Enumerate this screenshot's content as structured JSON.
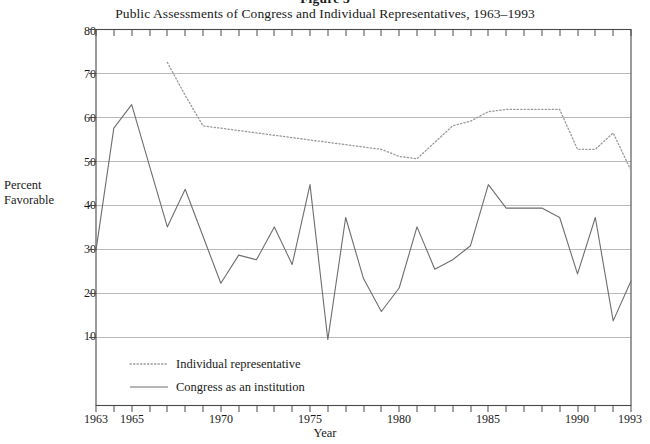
{
  "figure": {
    "number": "Figure 3",
    "title": "Public Assessments of Congress and Individual Representatives, 1963–1993"
  },
  "axes": {
    "y_title_line1": "Percent",
    "y_title_line2": "Favorable",
    "x_title": "Year",
    "y_ticks": [
      "80",
      "70",
      "60",
      "50",
      "40",
      "30",
      "20",
      "10"
    ],
    "x_ticks": [
      "1963",
      "1965",
      "1970",
      "1975",
      "1980",
      "1985",
      "1990",
      "1993"
    ]
  },
  "legend": {
    "items": [
      {
        "label": "Individual representative",
        "style": "dotted",
        "color": "#9a9a9a"
      },
      {
        "label": "Congress as an institution",
        "style": "solid",
        "color": "#6e6e6e"
      }
    ]
  },
  "colors": {
    "frame": "#4a4a4a",
    "gridline": "#b9b9b9",
    "congress_line": "#6e6e6e",
    "individual_line": "#9a9a9a",
    "text": "#1a1a1a"
  },
  "chart_data": {
    "type": "line",
    "title": "Public Assessments of Congress and Individual Representatives, 1963–1993",
    "subtitle": "Figure 3",
    "xlabel": "Year",
    "ylabel": "Percent Favorable",
    "xlim": [
      1963,
      1993
    ],
    "ylim": [
      0,
      80
    ],
    "yticks": [
      10,
      20,
      30,
      40,
      50,
      60,
      70,
      80
    ],
    "xticks": [
      1963,
      1965,
      1970,
      1975,
      1980,
      1985,
      1990,
      1993
    ],
    "grid": "horizontal",
    "legend_position": "inside-bottom-left",
    "series": [
      {
        "name": "Individual representative",
        "style": "dotted",
        "color": "#9a9a9a",
        "x": [
          1967,
          1968,
          1969,
          1970,
          1971,
          1972,
          1973,
          1974,
          1975,
          1976,
          1977,
          1978,
          1979,
          1980,
          1981,
          1982,
          1983,
          1984,
          1985,
          1986,
          1987,
          1988,
          1989,
          1990,
          1991,
          1992,
          1993
        ],
        "values": [
          73.0,
          66.0,
          59.5,
          59.0,
          58.5,
          58.0,
          57.5,
          57.0,
          56.5,
          56.0,
          55.5,
          55.0,
          54.5,
          53.0,
          52.5,
          56.0,
          59.5,
          60.5,
          62.5,
          63.0,
          63.0,
          63.0,
          63.0,
          54.5,
          54.5,
          58.0,
          50.0
        ]
      },
      {
        "name": "Congress as an institution",
        "style": "solid",
        "color": "#6e6e6e",
        "x": [
          1963,
          1964,
          1965,
          1966,
          1967,
          1968,
          1969,
          1970,
          1971,
          1972,
          1973,
          1974,
          1975,
          1976,
          1977,
          1978,
          1979,
          1980,
          1981,
          1982,
          1983,
          1984,
          1985,
          1986,
          1987,
          1988,
          1989,
          1990,
          1991,
          1992,
          1993
        ],
        "values": [
          33.0,
          59.0,
          64.0,
          51.0,
          38.0,
          46.0,
          36.0,
          26.0,
          32.0,
          31.0,
          38.0,
          30.0,
          47.0,
          14.0,
          40.0,
          27.0,
          20.0,
          25.0,
          38.0,
          29.0,
          31.0,
          34.0,
          47.0,
          42.0,
          42.0,
          42.0,
          40.0,
          28.0,
          40.0,
          18.0,
          26.5
        ]
      }
    ]
  }
}
